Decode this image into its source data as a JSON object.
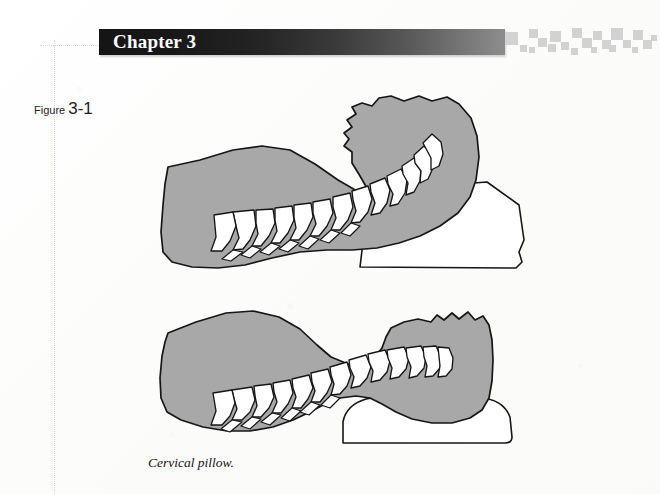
{
  "page": {
    "background_color": "#fdfdfc",
    "width": 660,
    "height": 494
  },
  "header": {
    "chapter_title": "Chapter 3",
    "banner_gradient_from": "#151515",
    "banner_gradient_to": "#8d8d8d",
    "title_color": "#ffffff",
    "decoration_name": "checker-blocks",
    "decoration_color": "#d2d2d2"
  },
  "figure": {
    "label_word": "Figure",
    "label_number": "3-1",
    "caption": "Cervical pillow.",
    "body_fill_color": "#a8a8a8",
    "outline_color": "#161616",
    "bone_fill_color": "#ffffff",
    "pillow_fill_color": "#ffffff",
    "panels": [
      {
        "name": "upper-panel",
        "description": "Head and neck on a flat wedge pillow with cervical spine flexed forward",
        "pillow_type": "flat-wedge-pillow",
        "vertebra_count": 12
      },
      {
        "name": "lower-panel",
        "description": "Head and neck on a contoured cervical pillow with neutral cervical curve",
        "pillow_type": "contoured-cervical-pillow",
        "vertebra_count": 12
      }
    ]
  },
  "guides": {
    "vertical_rule_name": "crop-guide-vertical",
    "horizontal_rule_name": "crop-guide-horizontal",
    "color": "#d6d6d2"
  }
}
